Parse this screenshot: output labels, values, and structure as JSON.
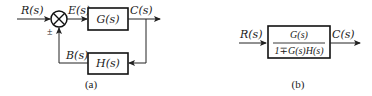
{
  "diagram_a": {
    "caption": "(a)",
    "input_label": "R(s)",
    "error_label": "E(s)",
    "forward_block": "G(s)",
    "output_label": "C(s)",
    "feedback_block": "H(s)",
    "feedback_signal_label": "B(s)",
    "sum_sign": "±"
  },
  "diagram_b": {
    "caption": "(b)",
    "input_label": "R(s)",
    "block_numerator": "G(s)",
    "block_denominator": "1∓G(s)H(s)",
    "output_label": "C(s)"
  },
  "colors": {
    "stroke": "#222222",
    "background": "#ffffff"
  }
}
